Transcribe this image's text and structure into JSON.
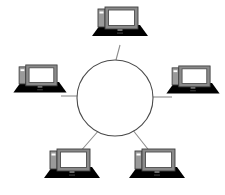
{
  "diagram": {
    "type": "network-topology",
    "topology_name": "star",
    "title": "",
    "background_color": "#ffffff",
    "canvas": {
      "width": 225,
      "height": 195
    },
    "hub": {
      "label": "",
      "shape": "circle",
      "cx": 115,
      "cy": 98,
      "r": 38,
      "stroke_color": "#4a4a4a",
      "fill_color": "#ffffff",
      "stroke_width": 1.1
    },
    "link_style": {
      "stroke_color": "#8d8d8d",
      "stroke_width": 1.1
    },
    "node_style": {
      "base_color": "#000000",
      "bezel_color": "#8a8a8a",
      "bezel_dark_color": "#4d4d4d",
      "screen_color": "#ffffff",
      "tower_color": "#9a9a9a",
      "outline_color": "#3d3d3d"
    },
    "nodes": [
      {
        "id": "node-top",
        "label": "",
        "position": "top",
        "x": 120,
        "y": 26,
        "scale": 1.0,
        "link": {
          "x1": 120,
          "y1": 45,
          "x2": 116,
          "y2": 60
        }
      },
      {
        "id": "node-left",
        "label": "",
        "position": "left",
        "x": 40,
        "y": 83,
        "scale": 0.95,
        "link": {
          "x1": 61,
          "y1": 96,
          "x2": 77,
          "y2": 96
        }
      },
      {
        "id": "node-right",
        "label": "",
        "position": "right",
        "x": 193,
        "y": 84,
        "scale": 0.95,
        "link": {
          "x1": 153,
          "y1": 97,
          "x2": 172,
          "y2": 97
        }
      },
      {
        "id": "node-bottom-left",
        "label": "",
        "position": "bottom-left",
        "x": 72,
        "y": 168,
        "scale": 1.0,
        "link": {
          "x1": 100,
          "y1": 129,
          "x2": 81,
          "y2": 152
        }
      },
      {
        "id": "node-bottom-right",
        "label": "",
        "position": "bottom-right",
        "x": 157,
        "y": 168,
        "scale": 1.0,
        "link": {
          "x1": 132,
          "y1": 129,
          "x2": 150,
          "y2": 152
        }
      }
    ]
  }
}
